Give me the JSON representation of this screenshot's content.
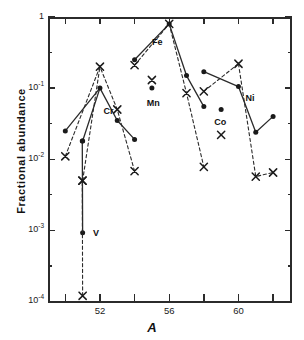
{
  "chart_data": {
    "type": "line",
    "title": "",
    "xlabel": "A",
    "ylabel": "Fractional abundance",
    "xlim": [
      49,
      63
    ],
    "ylim": [
      0.0001,
      1
    ],
    "yscale": "log",
    "grid": false,
    "legend_position": "none",
    "x_ticks": [
      50,
      52,
      54,
      56,
      58,
      60,
      62
    ],
    "x_tick_labels": [
      "",
      "52",
      "",
      "56",
      "",
      "60",
      ""
    ],
    "y_ticks": [
      1,
      0.1,
      0.01,
      0.001,
      0.0001
    ],
    "y_tick_labels": [
      "1",
      "10-1",
      "10-2",
      "10-3",
      "10-4"
    ],
    "series": [
      {
        "name": "calculated",
        "marker": "filled-circle",
        "linestyle": "solid",
        "segments": [
          {
            "x": [
              50,
              52,
              53,
              54
            ],
            "y": [
              0.025,
              0.1,
              0.035,
              0.019
            ]
          },
          {
            "x": [
              51,
              52
            ],
            "y": [
              0.018,
              0.1
            ]
          },
          {
            "x": [
              51,
              50.98
            ],
            "y": [
              0.00092,
              0.018
            ]
          },
          {
            "x": [
              54,
              56
            ],
            "y": [
              0.25,
              0.8
            ]
          },
          {
            "x": [
              56,
              57,
              58
            ],
            "y": [
              0.8,
              0.15,
              0.055
            ]
          },
          {
            "x": [
              58,
              60
            ],
            "y": [
              0.17,
              0.105
            ]
          },
          {
            "x": [
              60,
              61,
              62
            ],
            "y": [
              0.105,
              0.024,
              0.04
            ]
          }
        ],
        "isolated_points": [
          {
            "x": 55,
            "y": 0.1,
            "label": "Mn"
          },
          {
            "x": 59,
            "y": 0.05,
            "label": "Co"
          }
        ]
      },
      {
        "name": "observed",
        "marker": "cross",
        "linestyle": "dashed",
        "segments": [
          {
            "x": [
              50,
              52,
              53,
              54
            ],
            "y": [
              0.011,
              0.2,
              0.05,
              0.0068
            ]
          },
          {
            "x": [
              51,
              52
            ],
            "y": [
              0.005,
              0.2
            ]
          },
          {
            "x": [
              51,
              50.98
            ],
            "y": [
              0.00012,
              0.005
            ]
          },
          {
            "x": [
              54,
              56
            ],
            "y": [
              0.21,
              0.8
            ]
          },
          {
            "x": [
              56,
              57,
              58
            ],
            "y": [
              0.8,
              0.085,
              0.0078
            ]
          },
          {
            "x": [
              58,
              60
            ],
            "y": [
              0.09,
              0.22
            ]
          },
          {
            "x": [
              60,
              61,
              62
            ],
            "y": [
              0.22,
              0.0057,
              0.0065
            ]
          }
        ],
        "isolated_points": [
          {
            "x": 55,
            "y": 0.13,
            "label": "Mn"
          },
          {
            "x": 59,
            "y": 0.022,
            "label": "Co"
          }
        ]
      }
    ],
    "annotations": [
      {
        "text": "V",
        "x": 51.6,
        "y": 0.00093
      },
      {
        "text": "Cr",
        "x": 52.2,
        "y": 0.047
      },
      {
        "text": "Fe",
        "x": 55.0,
        "y": 0.44
      },
      {
        "text": "Mn",
        "x": 54.7,
        "y": 0.062
      },
      {
        "text": "Co",
        "x": 58.6,
        "y": 0.033
      },
      {
        "text": "Ni",
        "x": 60.4,
        "y": 0.072
      }
    ]
  },
  "axes": {
    "y_title": "Fractional abundance",
    "x_title": "A",
    "y_labels": [
      {
        "mantissa": "1",
        "exp": ""
      },
      {
        "mantissa": "10",
        "exp": "-1"
      },
      {
        "mantissa": "10",
        "exp": "-2"
      },
      {
        "mantissa": "10",
        "exp": "-3"
      },
      {
        "mantissa": "10",
        "exp": "-4"
      }
    ],
    "x_labels": [
      "52",
      "56",
      "60"
    ]
  },
  "element_labels": {
    "v": "V",
    "cr": "Cr",
    "fe": "Fe",
    "mn": "Mn",
    "co": "Co",
    "ni": "Ni"
  },
  "colors": {
    "ink": "#2b2b2b",
    "text": "#111111",
    "background": "#ffffff"
  }
}
